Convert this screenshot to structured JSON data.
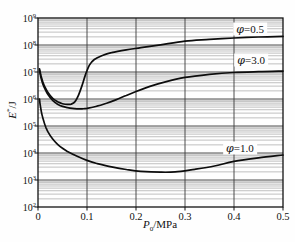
{
  "figure": {
    "background": "#fefefe",
    "frame_color": "#111111",
    "major_grid_color": "#3a3a3a",
    "minor_grid_color": "#8e8e8e",
    "curve_color": "#0d0d0d"
  },
  "chart_data": {
    "type": "line",
    "title": "",
    "xlabel": {
      "var": "P",
      "sub": "0",
      "unit": "/MPa"
    },
    "ylabel": {
      "var": "E",
      "sup": "*",
      "unit": "/J"
    },
    "x_range": [
      0,
      0.5
    ],
    "x_ticks": [
      0,
      0.1,
      0.2,
      0.3,
      0.4,
      0.5
    ],
    "x_tick_labels": [
      "0",
      "0.1",
      "0.2",
      "0.3",
      "0.4",
      "0.5"
    ],
    "y_scale": "log",
    "y_range": [
      100,
      1000000000
    ],
    "y_tick_exponents": [
      2,
      3,
      4,
      5,
      6,
      7,
      8,
      9
    ],
    "grid": "vertical majors at 0.1 steps; horizontal log decades with minor lines 2-9",
    "legend_position": "inline-labels",
    "series": [
      {
        "name": "phi-0.5",
        "symbol": "φ",
        "value_text": "=0.5",
        "label_anchor": {
          "x": 0.433,
          "y": 390000000
        },
        "points": [
          [
            0.003,
            13000000
          ],
          [
            0.006,
            7500000
          ],
          [
            0.01,
            4200000
          ],
          [
            0.015,
            2600000
          ],
          [
            0.02,
            1800000
          ],
          [
            0.03,
            1050000
          ],
          [
            0.04,
            790000
          ],
          [
            0.05,
            670000
          ],
          [
            0.06,
            630000
          ],
          [
            0.068,
            650000
          ],
          [
            0.075,
            780000
          ],
          [
            0.082,
            1300000
          ],
          [
            0.09,
            3200000
          ],
          [
            0.097,
            8000000
          ],
          [
            0.105,
            18000000
          ],
          [
            0.115,
            29000000
          ],
          [
            0.13,
            40000000
          ],
          [
            0.15,
            52000000
          ],
          [
            0.18,
            66000000
          ],
          [
            0.21,
            80000000
          ],
          [
            0.25,
            102000000
          ],
          [
            0.3,
            140000000
          ],
          [
            0.35,
            162000000
          ],
          [
            0.4,
            182000000
          ],
          [
            0.45,
            197000000
          ],
          [
            0.5,
            208000000
          ]
        ]
      },
      {
        "name": "phi-3.0",
        "symbol": "φ",
        "value_text": "=3.0",
        "label_anchor": {
          "x": 0.435,
          "y": 28000000
        },
        "points": [
          [
            0.003,
            11500000
          ],
          [
            0.006,
            6300000
          ],
          [
            0.01,
            3500000
          ],
          [
            0.015,
            2200000
          ],
          [
            0.02,
            1500000
          ],
          [
            0.03,
            880000
          ],
          [
            0.04,
            640000
          ],
          [
            0.05,
            530000
          ],
          [
            0.06,
            480000
          ],
          [
            0.07,
            450000
          ],
          [
            0.08,
            435000
          ],
          [
            0.09,
            435000
          ],
          [
            0.1,
            450000
          ],
          [
            0.12,
            540000
          ],
          [
            0.14,
            700000
          ],
          [
            0.16,
            950000
          ],
          [
            0.18,
            1350000
          ],
          [
            0.2,
            1900000
          ],
          [
            0.23,
            3000000
          ],
          [
            0.26,
            4300000
          ],
          [
            0.3,
            6300000
          ],
          [
            0.35,
            8200000
          ],
          [
            0.4,
            9600000
          ],
          [
            0.45,
            10300000
          ],
          [
            0.5,
            10800000
          ]
        ]
      },
      {
        "name": "phi-1.0",
        "symbol": "φ",
        "value_text": "=1.0",
        "label_anchor": {
          "x": 0.412,
          "y": 15500
        },
        "points": [
          [
            0.003,
            1000000
          ],
          [
            0.005,
            520000
          ],
          [
            0.008,
            270000
          ],
          [
            0.012,
            145000
          ],
          [
            0.016,
            90000
          ],
          [
            0.02,
            62000
          ],
          [
            0.03,
            33000
          ],
          [
            0.04,
            21000
          ],
          [
            0.05,
            15000
          ],
          [
            0.06,
            11500
          ],
          [
            0.08,
            7600
          ],
          [
            0.1,
            5300
          ],
          [
            0.12,
            4100
          ],
          [
            0.15,
            3050
          ],
          [
            0.18,
            2450
          ],
          [
            0.21,
            2100
          ],
          [
            0.25,
            1950
          ],
          [
            0.28,
            2000
          ],
          [
            0.32,
            2500
          ],
          [
            0.36,
            3300
          ],
          [
            0.4,
            4900
          ],
          [
            0.45,
            6600
          ],
          [
            0.5,
            8400
          ]
        ]
      }
    ]
  }
}
